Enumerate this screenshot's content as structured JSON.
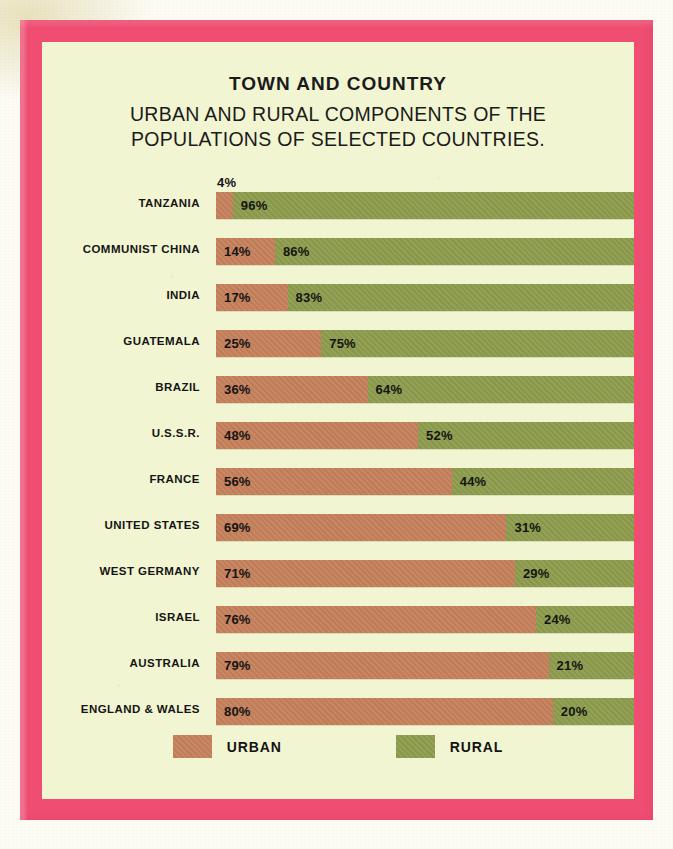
{
  "colors": {
    "frame": "#ef4e72",
    "panel_background": "#f2f5d2",
    "urban": "#c5805b",
    "rural": "#8c9c4c",
    "text": "#151515"
  },
  "titles": {
    "main": "TOWN AND COUNTRY",
    "sub_line1": "URBAN AND RURAL COMPONENTS OF THE",
    "sub_line2": "POPULATIONS OF SELECTED COUNTRIES."
  },
  "legend": {
    "urban_label": "URBAN",
    "rural_label": "RURAL"
  },
  "chart_data": {
    "type": "bar",
    "orientation": "horizontal",
    "stacked": true,
    "title": "TOWN AND COUNTRY",
    "subtitle": "URBAN AND RURAL COMPONENTS OF THE POPULATIONS OF SELECTED COUNTRIES.",
    "xlabel": "",
    "ylabel": "",
    "xlim": [
      0,
      100
    ],
    "grid": false,
    "legend_position": "bottom-center",
    "legend": [
      "URBAN",
      "RURAL"
    ],
    "categories": [
      "TANZANIA",
      "COMMUNIST CHINA",
      "INDIA",
      "GUATEMALA",
      "BRAZIL",
      "U.S.S.R.",
      "FRANCE",
      "UNITED STATES",
      "WEST GERMANY",
      "ISRAEL",
      "AUSTRALIA",
      "ENGLAND & WALES"
    ],
    "series": [
      {
        "name": "URBAN",
        "color": "#c5805b",
        "values": [
          4,
          14,
          17,
          25,
          36,
          48,
          56,
          69,
          71,
          76,
          79,
          80
        ]
      },
      {
        "name": "RURAL",
        "color": "#8c9c4c",
        "values": [
          96,
          86,
          83,
          75,
          64,
          52,
          44,
          31,
          29,
          24,
          21,
          20
        ]
      }
    ],
    "rows": [
      {
        "label": "TANZANIA",
        "urban": 4,
        "rural": 96,
        "urban_text": "4%",
        "rural_text": "96%"
      },
      {
        "label": "COMMUNIST CHINA",
        "urban": 14,
        "rural": 86,
        "urban_text": "14%",
        "rural_text": "86%"
      },
      {
        "label": "INDIA",
        "urban": 17,
        "rural": 83,
        "urban_text": "17%",
        "rural_text": "83%"
      },
      {
        "label": "GUATEMALA",
        "urban": 25,
        "rural": 75,
        "urban_text": "25%",
        "rural_text": "75%"
      },
      {
        "label": "BRAZIL",
        "urban": 36,
        "rural": 64,
        "urban_text": "36%",
        "rural_text": "64%"
      },
      {
        "label": "U.S.S.R.",
        "urban": 48,
        "rural": 52,
        "urban_text": "48%",
        "rural_text": "52%"
      },
      {
        "label": "FRANCE",
        "urban": 56,
        "rural": 44,
        "urban_text": "56%",
        "rural_text": "44%"
      },
      {
        "label": "UNITED STATES",
        "urban": 69,
        "rural": 31,
        "urban_text": "69%",
        "rural_text": "31%"
      },
      {
        "label": "WEST GERMANY",
        "urban": 71,
        "rural": 29,
        "urban_text": "71%",
        "rural_text": "29%"
      },
      {
        "label": "ISRAEL",
        "urban": 76,
        "rural": 24,
        "urban_text": "76%",
        "rural_text": "24%"
      },
      {
        "label": "AUSTRALIA",
        "urban": 79,
        "rural": 21,
        "urban_text": "79%",
        "rural_text": "21%"
      },
      {
        "label": "ENGLAND & WALES",
        "urban": 80,
        "rural": 20,
        "urban_text": "80%",
        "rural_text": "20%"
      }
    ]
  }
}
